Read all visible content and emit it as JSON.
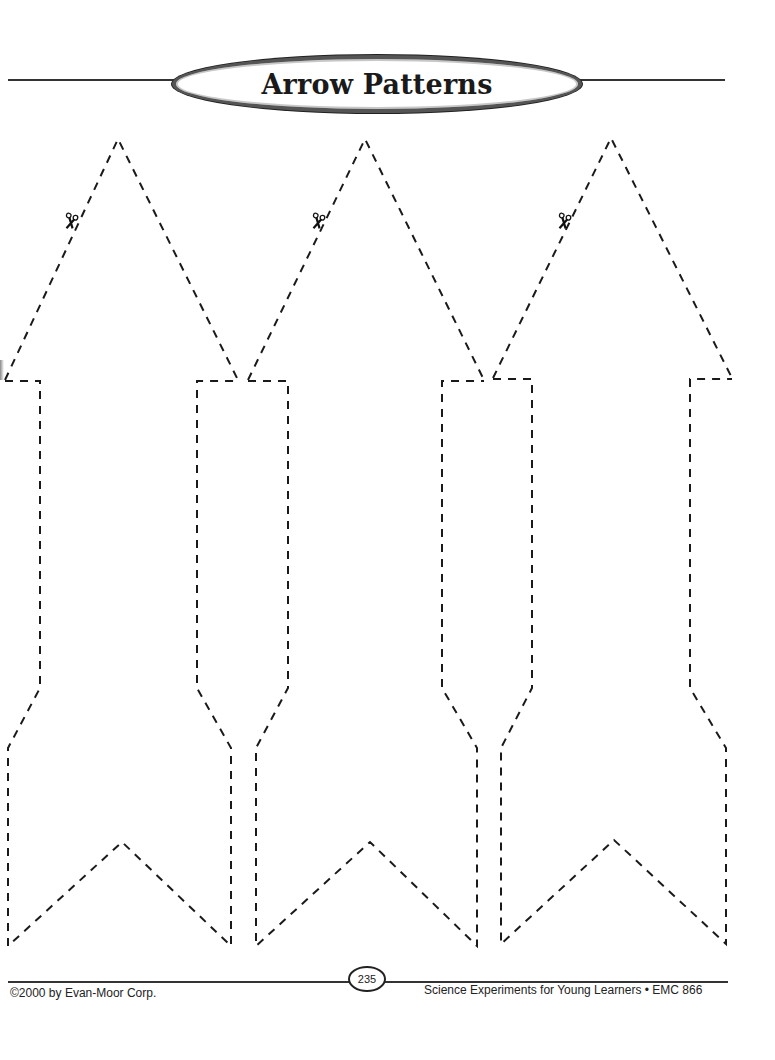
{
  "header": {
    "title": "Arrow Patterns"
  },
  "arrows": [
    {
      "label": "arrow-pattern-1",
      "icon": "scissors-icon"
    },
    {
      "label": "arrow-pattern-2",
      "icon": "scissors-icon"
    },
    {
      "label": "arrow-pattern-3",
      "icon": "scissors-icon"
    }
  ],
  "footer": {
    "copyright": "©2000 by Evan-Moor Corp.",
    "page_number": "235",
    "publication": "Science Experiments for Young Learners • EMC 866"
  },
  "colors": {
    "ink": "#1a1a1a",
    "oval_border": "#555555",
    "background": "#ffffff"
  }
}
